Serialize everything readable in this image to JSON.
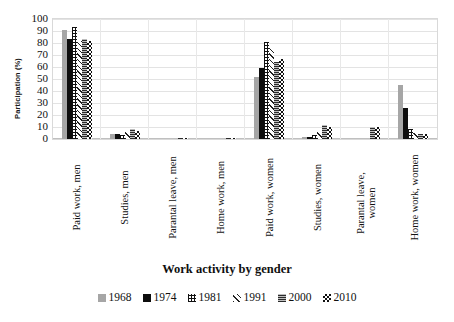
{
  "chart_data": {
    "type": "bar",
    "title": "",
    "xlabel": "Work activity by gender",
    "ylabel": "Participation (%)",
    "ylim": [
      0,
      100
    ],
    "ytick_step": 10,
    "yticks": [
      100,
      90,
      80,
      70,
      60,
      50,
      40,
      30,
      20,
      10,
      0
    ],
    "grid": true,
    "grid_axis": "y",
    "legend_position": "bottom",
    "categories": [
      "Paid work, men",
      "Studies, men",
      "Parantal leave, men",
      "Home work, men",
      "Paid work, women",
      "Studies, women",
      "Parantal leave, women",
      "Home work, women"
    ],
    "series": [
      {
        "name": "1968",
        "pattern": "solid-gray",
        "color": "#a6a6a6",
        "values": [
          91,
          4,
          0,
          0,
          52,
          2,
          0,
          45
        ]
      },
      {
        "name": "1974",
        "pattern": "solid-black",
        "color": "#0d0d0d",
        "values": [
          83,
          4,
          0,
          0,
          59,
          2,
          0,
          26
        ]
      },
      {
        "name": "1981",
        "pattern": "cross-hatch",
        "color": "#111111",
        "values": [
          93,
          3,
          0,
          0,
          81,
          3,
          0,
          8
        ]
      },
      {
        "name": "1991",
        "pattern": "diagonal",
        "color": "#222222",
        "values": [
          82,
          6,
          0,
          0,
          76,
          6,
          0,
          5
        ]
      },
      {
        "name": "2000",
        "pattern": "horizontal",
        "color": "#2b2b2b",
        "values": [
          83,
          8,
          1,
          1,
          64,
          12,
          10,
          4
        ]
      },
      {
        "name": "2010",
        "pattern": "checkerboard",
        "color": "#111111",
        "values": [
          82,
          7,
          1,
          1,
          67,
          10,
          10,
          4
        ]
      }
    ]
  },
  "axis": {
    "y_title": "Participation (%)",
    "x_title": "Work activity by gender"
  },
  "category_labels": [
    {
      "line1": "Paid work, men",
      "line2": ""
    },
    {
      "line1": "Studies, men",
      "line2": ""
    },
    {
      "line1": "Parantal leave, men",
      "line2": ""
    },
    {
      "line1": "Home work, men",
      "line2": ""
    },
    {
      "line1": "Paid work, women",
      "line2": ""
    },
    {
      "line1": "Studies, women",
      "line2": ""
    },
    {
      "line1": "Parantal leave,",
      "line2": "women"
    },
    {
      "line1": "Home work, women",
      "line2": ""
    }
  ],
  "legend": {
    "items": [
      {
        "label": "1968",
        "series_index": 0
      },
      {
        "label": "1974",
        "series_index": 1
      },
      {
        "label": "1981",
        "series_index": 2
      },
      {
        "label": "1991",
        "series_index": 3
      },
      {
        "label": "2000",
        "series_index": 4
      },
      {
        "label": "2010",
        "series_index": 5
      }
    ]
  }
}
